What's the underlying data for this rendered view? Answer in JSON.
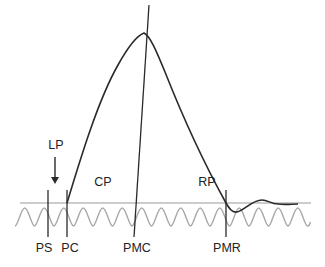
{
  "diagram": {
    "type": "waveform-schematic",
    "colors": {
      "curve": "#2a2a2a",
      "baseline": "#9a9a9a",
      "wave": "#a8a8a8",
      "markers": "#2a2a2a",
      "text": "#222222"
    },
    "labels": {
      "lp": "LP",
      "cp": "CP",
      "rp": "RP",
      "ps": "PS",
      "pc": "PC",
      "pmc": "PMC",
      "pmr": "PMR"
    },
    "markers": [
      {
        "id": "PS",
        "x": 48
      },
      {
        "id": "PC",
        "x": 67
      },
      {
        "id": "PMC",
        "x": 134
      },
      {
        "id": "PMR",
        "x": 226
      }
    ],
    "arrow": {
      "label": "LP",
      "direction": "down"
    }
  }
}
